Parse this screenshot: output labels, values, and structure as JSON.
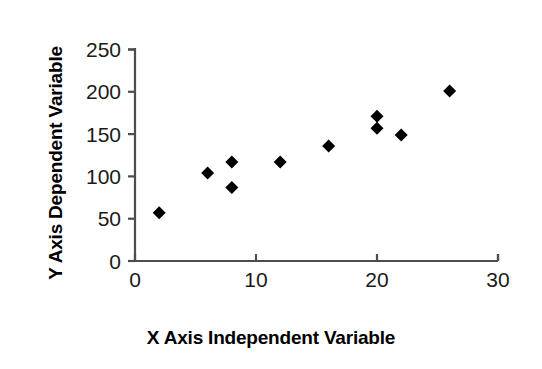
{
  "chart_data": {
    "type": "scatter",
    "title": "",
    "xlabel": "X Axis Independent Variable",
    "ylabel": "Y Axis Dependent Variable",
    "xlim": [
      0,
      30
    ],
    "ylim": [
      0,
      250
    ],
    "xticks": [
      0,
      10,
      20,
      30
    ],
    "yticks": [
      0,
      50,
      100,
      150,
      200,
      250
    ],
    "xtick_labels": [
      "0",
      "10",
      "20",
      "30"
    ],
    "ytick_labels": [
      "0",
      "50",
      "100",
      "150",
      "200",
      "250"
    ],
    "y_minor_ticks": [
      0,
      50,
      100,
      150,
      200,
      250
    ],
    "grid": false,
    "legend": null,
    "marker": "diamond",
    "marker_color": "#000000",
    "marker_size": 11,
    "axis_color": "#4d4d4d",
    "background": "#ffffff",
    "series": [
      {
        "name": "data",
        "points": [
          {
            "x": 2,
            "y": 57
          },
          {
            "x": 6,
            "y": 104
          },
          {
            "x": 8,
            "y": 117
          },
          {
            "x": 8,
            "y": 87
          },
          {
            "x": 12,
            "y": 117
          },
          {
            "x": 16,
            "y": 136
          },
          {
            "x": 20,
            "y": 171
          },
          {
            "x": 20,
            "y": 157
          },
          {
            "x": 22,
            "y": 149
          },
          {
            "x": 26,
            "y": 201
          }
        ]
      }
    ]
  },
  "axes": {
    "x_title": "X Axis Independent Variable",
    "y_title": "Y Axis Dependent Variable"
  }
}
